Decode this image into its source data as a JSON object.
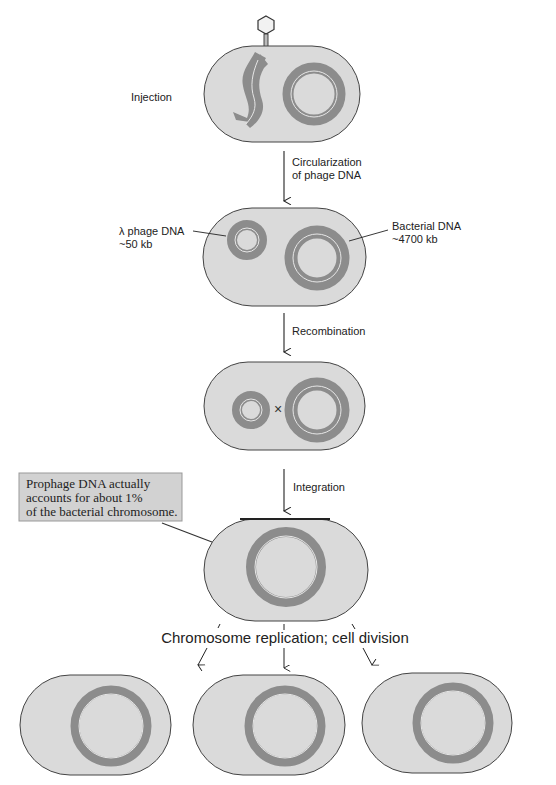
{
  "colors": {
    "cell_fill": "#dadada",
    "cell_stroke": "#444444",
    "dna": "#8c8c8c",
    "dna_highlight": "#e6e6e6",
    "callout_fill": "#d2d2d2",
    "callout_stroke": "#999999",
    "text": "#222222"
  },
  "labels": {
    "injection": "Injection",
    "circ_line1": "Circularization",
    "circ_line2": "of phage DNA",
    "lambda_line1": "λ phage DNA",
    "lambda_line2": "~50 kb",
    "bacterial_line1": "Bacterial DNA",
    "bacterial_line2": "~4700 kb",
    "recombination": "Recombination",
    "crossover_mark": "×",
    "integration": "Integration",
    "replication": "Chromosome replication; cell division"
  },
  "callout": {
    "line1": "Prophage DNA actually",
    "line2": "accounts for about 1%",
    "line3": "of the bacterial chromosome."
  },
  "stages": [
    {
      "id": "injection",
      "name": "Phage injects DNA into bacterium"
    },
    {
      "id": "circularization",
      "name": "Phage DNA circularizes"
    },
    {
      "id": "recombination",
      "name": "Recombination between phage and bacterial DNA"
    },
    {
      "id": "integration",
      "name": "Prophage integrated into chromosome"
    },
    {
      "id": "division",
      "name": "Three daughter cells carrying prophage"
    }
  ]
}
